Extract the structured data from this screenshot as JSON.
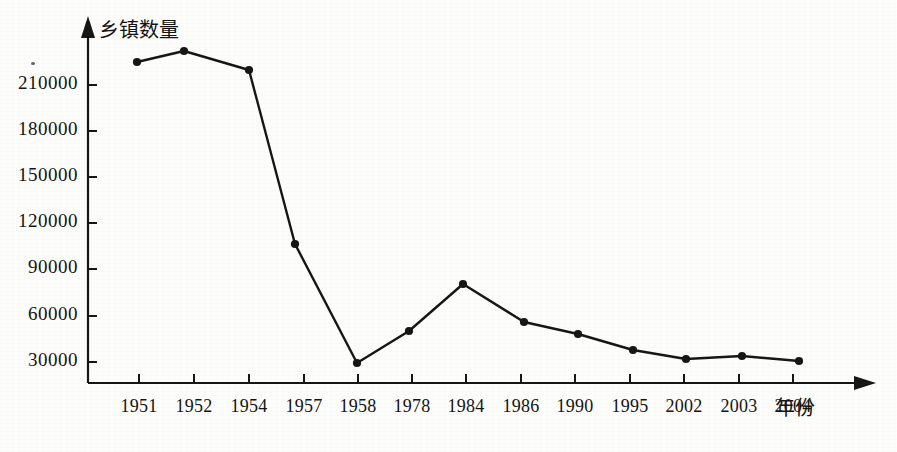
{
  "figure": {
    "background_color": "#fdfdfb",
    "ink_color": "#161616",
    "y_axis_title": "乡镇数量",
    "x_axis_title": "年份"
  },
  "chart_data": {
    "type": "line",
    "title": "",
    "subtitle": "",
    "xlabel": "年份",
    "ylabel": "乡镇数量",
    "categories": [
      "1951",
      "1952",
      "1954",
      "1957",
      "1958",
      "1978",
      "1984",
      "1986",
      "1990",
      "1995",
      "2002",
      "2003",
      "2004"
    ],
    "values": [
      225000,
      231000,
      220000,
      106000,
      30000,
      50000,
      80000,
      57000,
      48000,
      38000,
      32000,
      34000,
      30500
    ],
    "series": [
      {
        "name": "乡镇数量",
        "values": [
          225000,
          231000,
          220000,
          106000,
          30000,
          50000,
          80000,
          57000,
          48000,
          38000,
          32000,
          34000,
          30500
        ]
      }
    ],
    "ytick_labels": [
      "30000",
      "60000",
      "90000",
      "120000",
      "150000",
      "180000",
      "210000"
    ],
    "ytick_values": [
      30000,
      60000,
      90000,
      120000,
      150000,
      180000,
      210000
    ],
    "ylim": [
      0,
      247000
    ],
    "grid": false,
    "legend": false,
    "legend_position": "none",
    "marker": "filled-circle",
    "line_color": "#161616",
    "marker_color": "#161616",
    "axis_arrowheads": true
  },
  "y_ticks": [
    {
      "label": "210000",
      "y": 85
    },
    {
      "label": "180000",
      "y": 131
    },
    {
      "label": "150000",
      "y": 177
    },
    {
      "label": "120000",
      "y": 223
    },
    {
      "label": "90000",
      "y": 269
    },
    {
      "label": "60000",
      "y": 316
    },
    {
      "label": "30000",
      "y": 362
    }
  ],
  "x_ticks": [
    {
      "label": "1951",
      "x": 139
    },
    {
      "label": "1952",
      "x": 194
    },
    {
      "label": "1954",
      "x": 249
    },
    {
      "label": "1957",
      "x": 304
    },
    {
      "label": "1958",
      "x": 358
    },
    {
      "label": "1978",
      "x": 412
    },
    {
      "label": "1984",
      "x": 466
    },
    {
      "label": "1986",
      "x": 521
    },
    {
      "label": "1990",
      "x": 575
    },
    {
      "label": "1995",
      "x": 630
    },
    {
      "label": "2002",
      "x": 684
    },
    {
      "label": "2003",
      "x": 739
    },
    {
      "label": "2004",
      "x": 793
    }
  ],
  "points": [
    {
      "year": "1951",
      "value": 225000,
      "x": 137,
      "y": 62
    },
    {
      "year": "1952",
      "value": 231000,
      "x": 184,
      "y": 51
    },
    {
      "year": "1954",
      "value": 220000,
      "x": 249,
      "y": 70
    },
    {
      "year": "1957",
      "value": 106000,
      "x": 295,
      "y": 244
    },
    {
      "year": "1958",
      "value": 30000,
      "x": 357,
      "y": 363
    },
    {
      "year": "1978",
      "value": 50000,
      "x": 409,
      "y": 331
    },
    {
      "year": "1984",
      "value": 80000,
      "x": 463,
      "y": 284
    },
    {
      "year": "1986",
      "value": 57000,
      "x": 524,
      "y": 322
    },
    {
      "year": "1990",
      "value": 48000,
      "x": 578,
      "y": 334
    },
    {
      "year": "1995",
      "value": 38000,
      "x": 633,
      "y": 350
    },
    {
      "year": "2002",
      "value": 32000,
      "x": 686,
      "y": 359
    },
    {
      "year": "2003",
      "value": 34000,
      "x": 742,
      "y": 356
    },
    {
      "year": "2004",
      "value": 30500,
      "x": 799,
      "y": 361
    }
  ]
}
